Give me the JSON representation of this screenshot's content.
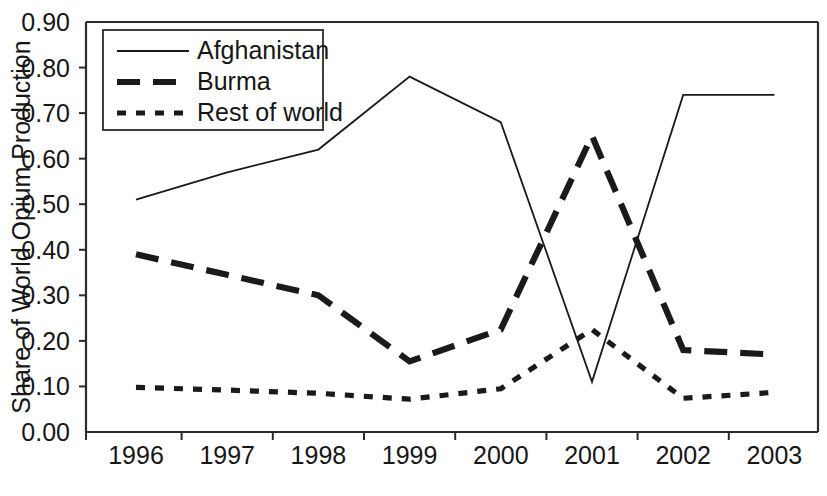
{
  "chart_data": {
    "type": "line",
    "title": "",
    "xlabel": "",
    "ylabel": "Share of World Opium Production",
    "categories": [
      "1996",
      "1997",
      "1998",
      "1999",
      "2000",
      "2001",
      "2002",
      "2003"
    ],
    "x": [
      1996,
      1997,
      1998,
      1999,
      2000,
      2001,
      2002,
      2003
    ],
    "ylim": [
      0.0,
      0.9
    ],
    "yticks": [
      "0.00",
      "0.10",
      "0.20",
      "0.30",
      "0.40",
      "0.50",
      "0.60",
      "0.70",
      "0.80",
      "0.90"
    ],
    "ytick_values": [
      0.0,
      0.1,
      0.2,
      0.3,
      0.4,
      0.5,
      0.6,
      0.7,
      0.8,
      0.9
    ],
    "grid": false,
    "legend_position": "top-left",
    "series": [
      {
        "name": "Afghanistan",
        "style": "solid",
        "values": [
          0.51,
          0.57,
          0.62,
          0.78,
          0.68,
          0.11,
          0.74,
          0.74
        ]
      },
      {
        "name": "Burma",
        "style": "dashed",
        "values": [
          0.39,
          0.345,
          0.3,
          0.155,
          0.225,
          0.65,
          0.18,
          0.17
        ]
      },
      {
        "name": "Rest of world",
        "style": "dotted",
        "values": [
          0.098,
          0.092,
          0.085,
          0.072,
          0.095,
          0.225,
          0.074,
          0.087
        ]
      }
    ]
  },
  "axes": {
    "y_title": "Share of World Opium Production"
  },
  "legend": {
    "entries": [
      {
        "label": "Afghanistan",
        "style": "solid"
      },
      {
        "label": "Burma",
        "style": "dashed"
      },
      {
        "label": "Rest of world",
        "style": "dotted"
      }
    ]
  },
  "colors": {
    "line": "#1a1a1a",
    "axis": "#2b2b2b",
    "text": "#161616",
    "background": "#ffffff"
  }
}
